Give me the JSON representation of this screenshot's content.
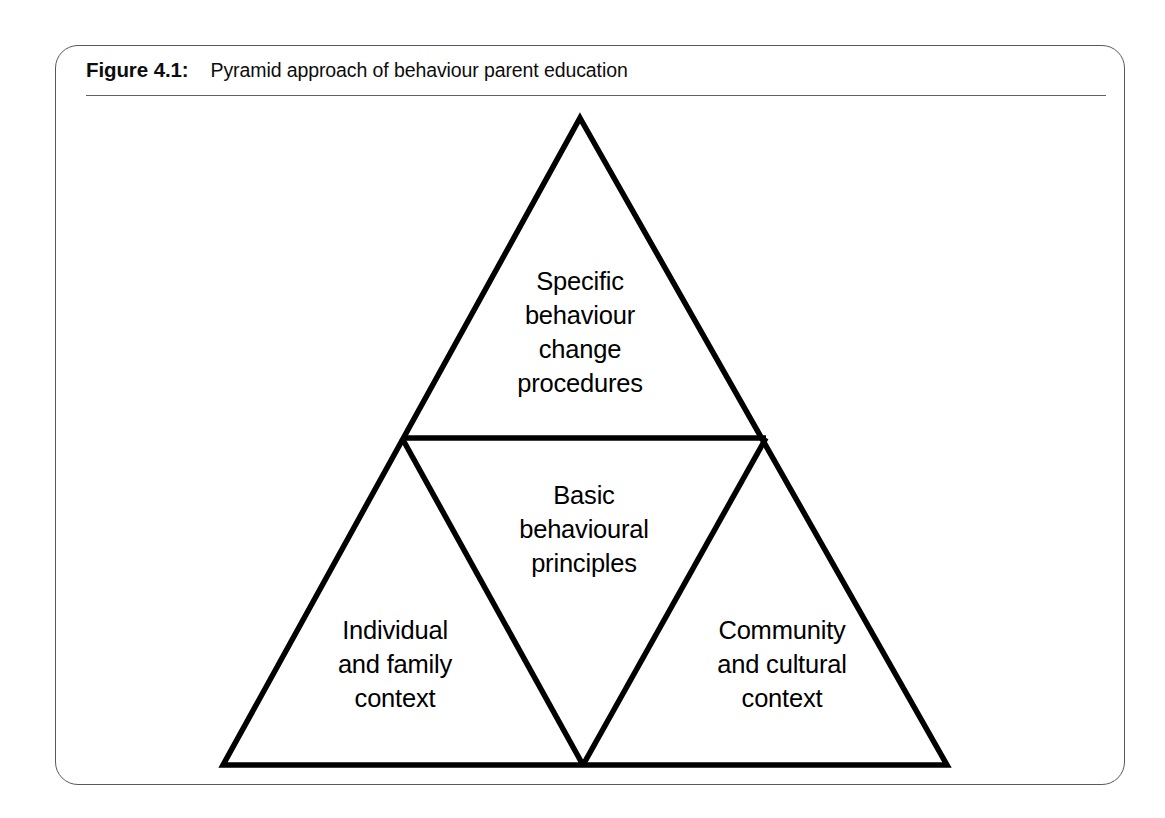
{
  "figure": {
    "label": "Figure 4.1:",
    "caption": "Pyramid approach of behaviour parent education"
  },
  "diagram": {
    "type": "pyramid",
    "title": "Pyramid approach of behaviour parent education",
    "line_color": "#000000",
    "frame_color": "#555a5e",
    "background_color": "#ffffff",
    "levels": [
      {
        "id": "top",
        "position": "apex",
        "text": "Specific\nbehaviour\nchange\nprocedures"
      },
      {
        "id": "middle",
        "position": "center-inverted",
        "text": "Basic\nbehavioural\nprinciples"
      },
      {
        "id": "bottom-left",
        "position": "base-left",
        "text": "Individual\nand family\ncontext"
      },
      {
        "id": "bottom-right",
        "position": "base-right",
        "text": "Community\nand cultural\ncontext"
      }
    ]
  }
}
